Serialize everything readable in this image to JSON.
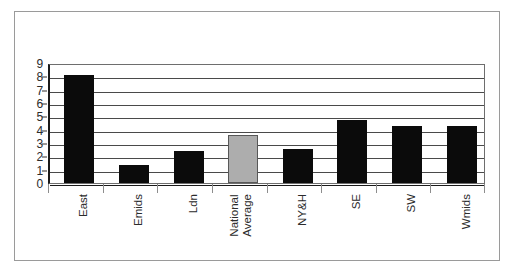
{
  "chart_data": {
    "type": "bar",
    "title": "",
    "subtitle": "",
    "xlabel": "",
    "ylabel": "",
    "categories": [
      "East",
      "Emids",
      "Ldn",
      "National Average",
      "NY&H",
      "SE",
      "SW",
      "Wmids"
    ],
    "category_lines": [
      [
        "East"
      ],
      [
        "Emids"
      ],
      [
        "Ldn"
      ],
      [
        "National",
        "Average"
      ],
      [
        "NY&H"
      ],
      [
        "SE"
      ],
      [
        "SW"
      ],
      [
        "Wmids"
      ]
    ],
    "values": [
      8.1,
      1.35,
      2.4,
      3.6,
      2.55,
      4.75,
      4.3,
      4.25
    ],
    "bar_colors": [
      "#0b0b0b",
      "#0b0b0b",
      "#0b0b0b",
      "#adadad",
      "#0b0b0b",
      "#0b0b0b",
      "#0b0b0b",
      "#0b0b0b"
    ],
    "highlight_index": 3,
    "ylim": [
      0,
      9
    ],
    "ytick_labels": [
      "0",
      "1",
      "2",
      "3",
      "4",
      "5",
      "6",
      "7",
      "8",
      "9"
    ],
    "ytick_values": [
      0,
      1,
      2,
      3,
      4,
      5,
      6,
      7,
      8,
      9
    ],
    "grid": true,
    "grid_axis": "y",
    "legend": false,
    "legend_position": "none",
    "annotations": []
  },
  "colors": {
    "bar_default": "#0b0b0b",
    "bar_highlight": "#adadad",
    "bar_highlight_border": "#585858",
    "gridline": "#4a4a4a",
    "axis": "#1a1a1a",
    "plot_border": "#6e6e6e",
    "figure_border": "#9a9a9a",
    "background": "#ffffff",
    "text": "#2b2b2b"
  }
}
